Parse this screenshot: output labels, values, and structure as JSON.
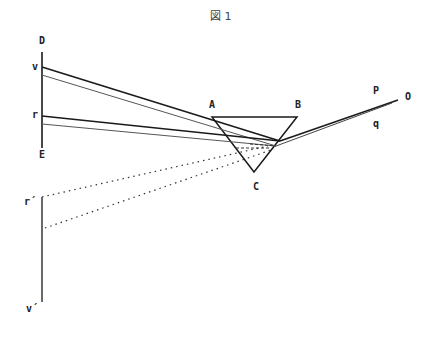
{
  "figure": {
    "title": "図 1"
  },
  "labels": {
    "D": "D",
    "E": "E",
    "v": "v",
    "r": "r",
    "A": "A",
    "B": "B",
    "C": "C",
    "P": "P",
    "q": "q",
    "O": "O",
    "r_prime": "r´",
    "v_prime": "v´"
  },
  "colors": {
    "line": "#1a1a1a",
    "ray_light": "#555555",
    "dotted": "#333333",
    "background": "#ffffff"
  }
}
